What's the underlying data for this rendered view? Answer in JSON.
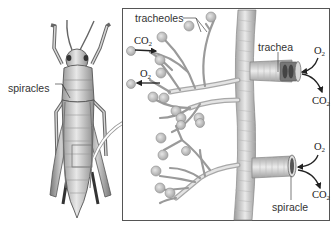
{
  "figure": {
    "colors": {
      "box_border": "#555555",
      "tube_fill": "#d6d6d6",
      "tube_shade": "#a8a8a8",
      "cell_fill": "#c8c8c8",
      "arrow": "#222222",
      "leader_line": "#444444"
    }
  },
  "labels": {
    "spiracles": "spiracles",
    "tracheoles": "tracheoles",
    "trachea": "trachea",
    "spiracle": "spiracle"
  },
  "gases": {
    "left_top": {
      "base": "CO",
      "sub": "2"
    },
    "left_bottom": {
      "base": "O",
      "sub": "2"
    },
    "right_top_in": {
      "base": "O",
      "sub": "2"
    },
    "right_top_out": {
      "base": "CO",
      "sub": "2"
    },
    "right_bottom_in": {
      "base": "O",
      "sub": "2"
    },
    "right_bottom_out": {
      "base": "CO",
      "sub": "2"
    }
  }
}
